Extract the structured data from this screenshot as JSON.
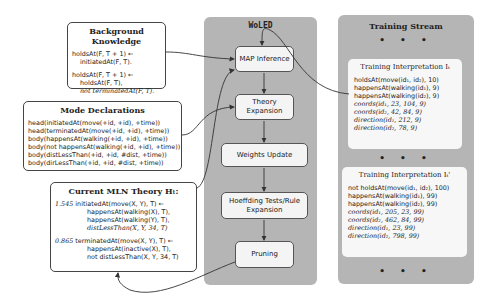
{
  "background_knowledge": {
    "title": "Background Knowledge",
    "rule1": [
      "holdsAt(F, T + 1) ←",
      "initiatedAt(F, T)."
    ],
    "rule2": [
      "holdsAt(F, T + 1) ←",
      "holdsAt(F, T),",
      "not terminatedAt(F, T)."
    ]
  },
  "mode_declarations": {
    "title": "Mode Declarations",
    "lines": [
      "head(initiatedAt(move(+id, +id), +time))",
      "head(terminatedAt(move(+id, +id), +time))",
      "body(happensAt(walking(+id, +id), +time))",
      "body(not happensAt(walking(+id, +id), +time))",
      "body(distLessThan(+id, +id, #dist, +time))",
      "body(dirLessThan(+id, +id, #dist, +time))"
    ]
  },
  "mln_theory": {
    "title": "Current MLN Theory Hₜ:",
    "rule1": {
      "weight": "1.545",
      "head": "initiatedAt(move(X, Y), T) ←",
      "body": [
        "happensAt(walking(X), T),",
        "happensAt(walking(Y), T),",
        "distLessThan(X, Y, 34, T)"
      ]
    },
    "rule2": {
      "weight": "0.865",
      "head": "terminatedAt(move(X, Y), T) ←",
      "body": [
        "happensAt(inactive(X), T),",
        "not distLessThan(X, Y, 34, T)"
      ]
    }
  },
  "woled": {
    "title": "WoLED",
    "steps": [
      {
        "label": "MAP Inference"
      },
      {
        "label": "Theory Expansion"
      },
      {
        "label": "Weights Update"
      },
      {
        "label": "Hoeffding Tests/Rule Expansion"
      },
      {
        "label": "Pruning"
      }
    ]
  },
  "training_stream": {
    "title": "Training Stream",
    "dots": "• • •",
    "interpretations": [
      {
        "title": "Training Interpretation Iₜ",
        "lines": [
          "holdsAt(move(id₁, id₂), 10)",
          "happensAt(walking(id₁), 9)",
          "happensAt(walking(id₂), 9)",
          "coords(id₁, 23, 104, 9)",
          "coords(id₂, 42, 84, 9)",
          "direction(id₁, 212, 9)",
          "direction(id₂, 78, 9)"
        ]
      },
      {
        "title": "Training Interpretation Iₜ'",
        "lines": [
          "not holdsAt(move(id₁, id₂), 100)",
          "happensAt(walking(id₁), 99)",
          "happensAt(walking(id₂), 99)",
          "coords(id₁, 205, 23, 99)",
          "coords(id₂, 462, 84, 99)",
          "direction(id₁, 23, 99)",
          "direction(id₂, 798, 99)"
        ]
      }
    ]
  },
  "colors": {
    "panel": "#b5b5b5",
    "step_fill": "#f4f4f4",
    "border": "#444444"
  }
}
